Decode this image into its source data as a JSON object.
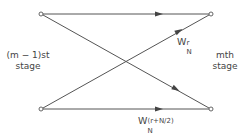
{
  "diagram": {
    "type": "butterfly",
    "left_stage_label": [
      "(m − 1)st",
      "stage"
    ],
    "right_stage_label": [
      "mth",
      "stage"
    ],
    "weights": {
      "upper": {
        "base": "W",
        "subscript": "N",
        "superscript": "r"
      },
      "lower": {
        "base": "W",
        "subscript": "N",
        "superscript": "(r+N/2)"
      }
    },
    "nodes": [
      {
        "id": "in-top",
        "x": 41,
        "y": 14
      },
      {
        "id": "in-bottom",
        "x": 41,
        "y": 109
      },
      {
        "id": "out-top",
        "x": 211,
        "y": 14
      },
      {
        "id": "out-bottom",
        "x": 211,
        "y": 109
      }
    ],
    "edges": [
      {
        "from": "in-top",
        "to": "out-top"
      },
      {
        "from": "in-top",
        "to": "out-bottom"
      },
      {
        "from": "in-bottom",
        "to": "out-top",
        "weight": "upper"
      },
      {
        "from": "in-bottom",
        "to": "out-bottom",
        "weight": "lower"
      }
    ],
    "line_color": "#555555"
  }
}
